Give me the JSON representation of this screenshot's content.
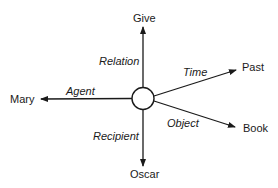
{
  "center": {
    "shape": "circle"
  },
  "nodes": {
    "give": "Give",
    "past": "Past",
    "mary": "Mary",
    "book": "Book",
    "oscar": "Oscar"
  },
  "relations": {
    "relation": "Relation",
    "time": "Time",
    "agent": "Agent",
    "object": "Object",
    "recipient": "Recipient"
  },
  "colors": {
    "ink": "#1a1a1a",
    "background": "#ffffff"
  }
}
